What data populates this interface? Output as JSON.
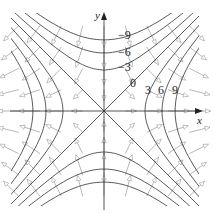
{
  "figure": {
    "axes": {
      "x_label": "x",
      "y_label": "y"
    },
    "level_values": [
      -9,
      -6,
      -3,
      0,
      3,
      6,
      9
    ],
    "level_labels": {
      "neg9": "−9",
      "neg6": "−6",
      "neg3": "−3",
      "zero": "0",
      "pos3": "3",
      "pos6": "6",
      "pos9": "9"
    },
    "colors": {
      "curves": "#3c3c3c",
      "axes": "#2a2a2a",
      "gradient_vectors": "#9a9a9a",
      "background": "#ffffff"
    }
  }
}
